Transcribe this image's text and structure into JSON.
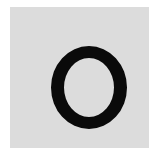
{
  "card": {
    "letter": "O",
    "background_color": "#dcdcdc",
    "letter_color": "#0a0a0a"
  }
}
